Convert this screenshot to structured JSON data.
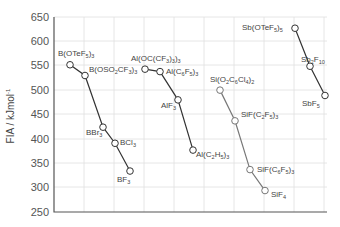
{
  "chart_data": {
    "type": "line",
    "title": "",
    "xlabel": "",
    "ylabel": "FIA / kJ mol⁻¹",
    "ylim": [
      250,
      650
    ],
    "yticks": [
      250,
      300,
      350,
      400,
      450,
      500,
      550,
      600,
      650
    ],
    "grid": true,
    "legend": "none",
    "series": [
      {
        "name": "Boron",
        "color": "#333333",
        "points": [
          {
            "label": "B(OTeF5)3",
            "x": 1.0,
            "y": 552
          },
          {
            "label": "B(OSO2CF3)3",
            "x": 1.5,
            "y": 530
          },
          {
            "label": "BBr3",
            "x": 2.1,
            "y": 424
          },
          {
            "label": "BCl3",
            "x": 2.5,
            "y": 391
          },
          {
            "label": "BF3",
            "x": 3.0,
            "y": 334
          }
        ]
      },
      {
        "name": "Aluminium",
        "color": "#333333",
        "points": [
          {
            "label": "Al(OC(CF3)3)3",
            "x": 3.5,
            "y": 543
          },
          {
            "label": "Al(C6F5)3",
            "x": 4.0,
            "y": 538
          },
          {
            "label": "AlF3",
            "x": 4.6,
            "y": 480
          },
          {
            "label": "Al(C2H5)3",
            "x": 5.1,
            "y": 377
          }
        ]
      },
      {
        "name": "Silicon",
        "color": "#777777",
        "points": [
          {
            "label": "Si(O2C6Cl4)2",
            "x": 6.0,
            "y": 500
          },
          {
            "label": "SiF(C2F5)3",
            "x": 6.5,
            "y": 437
          },
          {
            "label": "SiF(C6F5)3",
            "x": 7.0,
            "y": 337
          },
          {
            "label": "SiF4",
            "x": 7.5,
            "y": 294
          }
        ]
      },
      {
        "name": "Antimony",
        "color": "#333333",
        "points": [
          {
            "label": "Sb(OTeF5)5",
            "x": 8.5,
            "y": 627
          },
          {
            "label": "Sb2F10",
            "x": 9.0,
            "y": 549
          },
          {
            "label": "SbF5",
            "x": 9.5,
            "y": 489
          }
        ]
      }
    ]
  },
  "axis": {
    "y_title": "FIA / kJmol",
    "y_title_sup": "-1",
    "y_tick_labels": [
      "650",
      "600",
      "550",
      "500",
      "450",
      "400",
      "350",
      "300",
      "250"
    ]
  },
  "labels": {
    "b_oteF": {
      "main": "B(OTeF",
      "sub1": "5",
      "mid": ")",
      "sub2": "3"
    },
    "b_oso": {
      "main": "B(OSO",
      "sub1": "2",
      "mid": "CF",
      "sub2": "3",
      "end": ")",
      "sub3": "3"
    },
    "bbr3": {
      "main": "BBr",
      "sub1": "3"
    },
    "bcl3": {
      "main": "BCl",
      "sub1": "3"
    },
    "bf3": {
      "main": "BF",
      "sub1": "3"
    },
    "al_oc": {
      "main": "Al(OC(CF",
      "sub1": "3",
      "mid": ")",
      "sub2": "3",
      "end": ")",
      "sub3": "3"
    },
    "al_c6f5": {
      "main": "Al(C",
      "sub1": "6",
      "mid": "F",
      "sub2": "5",
      "end": ")",
      "sub3": "3"
    },
    "alf3": {
      "main": "AlF",
      "sub1": "3"
    },
    "al_c2h5": {
      "main": "Al(C",
      "sub1": "2",
      "mid": "H",
      "sub2": "5",
      "end": ")",
      "sub3": "3"
    },
    "si_o2": {
      "main": "Si(O",
      "sub1": "2",
      "mid": "C",
      "sub2": "6",
      "mid2": "Cl",
      "sub3": "4",
      "end": ")",
      "sub4": "2"
    },
    "sif_c2f5": {
      "main": "SiF(C",
      "sub1": "2",
      "mid": "F",
      "sub2": "5",
      "end": ")",
      "sub3": "3"
    },
    "sif_c6f5": {
      "main": "SiF(C",
      "sub1": "6",
      "mid": "F",
      "sub2": "5",
      "end": ")",
      "sub3": "3"
    },
    "sif4": {
      "main": "SiF",
      "sub1": "4"
    },
    "sb_otef": {
      "main": "Sb(OTeF",
      "sub1": "5",
      "mid": ")",
      "sub2": "5"
    },
    "sb2f10": {
      "main": "Sb",
      "sub1": "2",
      "mid": "F",
      "sub2": "10"
    },
    "sbf5": {
      "main": "SbF",
      "sub1": "5"
    }
  }
}
